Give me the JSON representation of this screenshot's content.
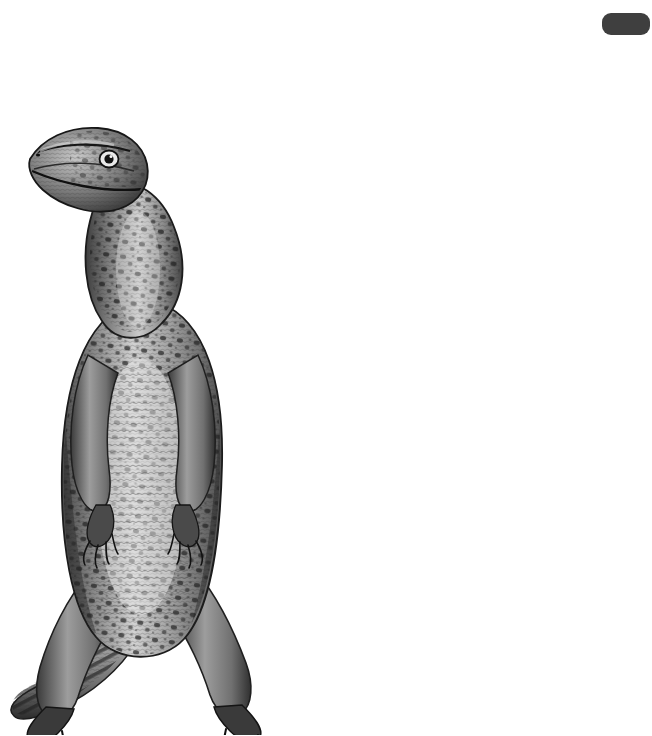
{
  "page": {
    "number": "303",
    "corner_tab": "dark-rounded-tab"
  },
  "axis": {
    "title": "Million years ago",
    "ticks": [
      {
        "label": "65",
        "x": 5
      },
      {
        "label": "54",
        "x": 59
      },
      {
        "label": "34",
        "x": 152
      },
      {
        "label": "24",
        "x": 203
      },
      {
        "label": "5",
        "x": 281
      },
      {
        "label": "2",
        "x": 322
      }
    ]
  },
  "epochs": [
    {
      "name": "PALEOCENE",
      "x": 0,
      "w": 57,
      "fill": "hatch"
    },
    {
      "name": "EOCENE",
      "x": 57,
      "w": 93,
      "fill": "hatch"
    },
    {
      "name": "OLIGOCENE",
      "x": 150,
      "w": 52,
      "fill": "plain"
    },
    {
      "name": "MIOCENE",
      "x": 202,
      "w": 77,
      "fill": "light"
    },
    {
      "name": "PLIOCENE",
      "x": 279,
      "w": 41,
      "fill": "plain"
    },
    {
      "name": "PLEISTOCENE",
      "x": 320,
      "w": 34,
      "fill": "white"
    },
    {
      "name": "HOLOCENE",
      "x": 354,
      "w": 7,
      "fill": "plain",
      "faint": true
    }
  ],
  "tree": {
    "taxa": [
      {
        "name": "LEIOLEPIDINAE",
        "label_x": 357,
        "label_y": 117,
        "branch_y": 106,
        "branch_x0": 260
      },
      {
        "name": "CHAMAELEONIDAE",
        "label_x": 357,
        "label_y": 171,
        "branch_y": 160,
        "branch_x0": 146
      },
      {
        "name": "AGAMINAE",
        "label_x": 357,
        "label_y": 227,
        "branch_y": 216,
        "branch_x0": 260
      },
      {
        "name": "IGUANINAE",
        "label_x": 357,
        "label_y": 272,
        "branch_y": 261,
        "branch_x0": 146
      },
      {
        "name": "GEKKOTA",
        "label_x": 357,
        "label_y": 327,
        "branch_y": 316,
        "branch_x0": 152
      },
      {
        "name": "DIBAMIDAE",
        "label_x": 357,
        "label_y": 378,
        "branch_y": 367,
        "branch_x0": 152
      },
      {
        "name": "SERPENTES",
        "label_x": 357,
        "label_y": 427,
        "branch_y": 416,
        "branch_x0": 152
      },
      {
        "name": "AMPHISBAENIA",
        "label_x": 357,
        "label_y": 473,
        "branch_y": 462,
        "branch_x0": 152
      },
      {
        "name": "SCINCOIDEA",
        "label_x": 357,
        "label_y": 518,
        "branch_y": 507,
        "branch_x0": 262
      },
      {
        "name": "LACERTOIDEA",
        "label_x": 357,
        "label_y": 564,
        "branch_y": 553,
        "branch_x0": 262
      },
      {
        "name": "VARANOIDEA",
        "label_x": 357,
        "label_y": 610,
        "branch_y": 599,
        "branch_x0": 262
      },
      {
        "name": "ANGUIDAE",
        "label_x": 357,
        "label_y": 656,
        "branch_y": 645,
        "branch_x0": 262
      }
    ],
    "clades": [
      {
        "name": "IGUANIA",
        "label_x": 147,
        "label_y": 155,
        "node_x": 36,
        "node_y": 160
      },
      {
        "name": "ACRODONTA",
        "label_x": 260,
        "label_y": 155,
        "node_x": 146,
        "node_y": 160
      },
      {
        "name": "SCLEROGLOSSA",
        "label_x": 152,
        "label_y": 456,
        "node_x": 36,
        "node_y": 462
      },
      {
        "name": "SCINCOMORPHA",
        "label_x": 262,
        "label_y": 525,
        "node_x": 152,
        "node_y": 530
      },
      {
        "name": "ANGUIMORPHA",
        "label_x": 262,
        "label_y": 617,
        "node_x": 152,
        "node_y": 622
      }
    ],
    "root": {
      "x": -10,
      "y": 311
    },
    "line_color": "#9a9a9a",
    "line_width": 4.6
  },
  "left_text_fragments": [
    {
      "t": "s",
      "y": 105
    },
    {
      "t": "s",
      "y": 127
    },
    {
      "t": "s",
      "y": 149
    },
    {
      "t": "s",
      "y": 203
    },
    {
      "t": "s",
      "y": 225
    },
    {
      "t": "s",
      "y": 247
    },
    {
      "t": "s",
      "y": 269
    },
    {
      "t": "s",
      "y": 291
    },
    {
      "t": "s",
      "y": 313
    },
    {
      "t": "s",
      "y": 335
    },
    {
      "t": "s",
      "y": 357
    },
    {
      "t": "s",
      "y": 411
    },
    {
      "t": "s",
      "y": 433
    },
    {
      "t": "s",
      "y": 455
    },
    {
      "t": "s",
      "y": 477
    },
    {
      "t": "l",
      "y": 499
    },
    {
      "t": "s",
      "y": 553
    },
    {
      "t": "s",
      "y": 575
    },
    {
      "t": "s",
      "y": 597
    },
    {
      "t": "s",
      "y": 619
    },
    {
      "t": "s",
      "y": 641
    }
  ],
  "illustration": {
    "name": "monitor-lizard-engraving",
    "description": "bipedal standing monitor lizard, black and white engraving"
  }
}
